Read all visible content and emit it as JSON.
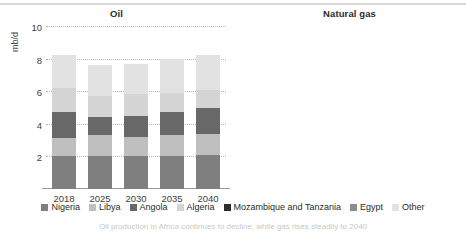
{
  "top_rule": true,
  "legend": {
    "items": [
      {
        "label": "Nigeria",
        "color": "#7f7f7f"
      },
      {
        "label": "Libya",
        "color": "#bfbfbf"
      },
      {
        "label": "Angola",
        "color": "#686868"
      },
      {
        "label": "Algeria",
        "color": "#d4d4d4"
      },
      {
        "label": "Mozambique and Tanzania",
        "color": "#2b2b2b"
      },
      {
        "label": "Egypt",
        "color": "#8c8c8c"
      },
      {
        "label": "Other",
        "color": "#e2e2e2"
      }
    ]
  },
  "caption": "Oil production in Africa continues to decline, while gas rises steadily to 2040",
  "chart_data": [
    {
      "type": "bar",
      "stacked": true,
      "title": "Oil",
      "xlabel": "",
      "ylabel": "mb/d",
      "ylim": [
        0,
        10
      ],
      "yticks": [
        2,
        4,
        6,
        8,
        10
      ],
      "grid": true,
      "legend_position": "bottom",
      "categories": [
        "2018",
        "2025",
        "2030",
        "2035",
        "2040"
      ],
      "series": [
        {
          "name": "Nigeria",
          "color": "#7f7f7f",
          "values": [
            2.0,
            2.0,
            2.0,
            2.0,
            2.1
          ]
        },
        {
          "name": "Libya",
          "color": "#bfbfbf",
          "values": [
            1.1,
            1.3,
            1.2,
            1.3,
            1.3
          ]
        },
        {
          "name": "Angola",
          "color": "#686868",
          "values": [
            1.6,
            1.1,
            1.3,
            1.4,
            1.6
          ]
        },
        {
          "name": "Algeria",
          "color": "#d4d4d4",
          "values": [
            1.5,
            1.3,
            1.3,
            1.2,
            1.1
          ]
        },
        {
          "name": "Mozambique and Tanzania",
          "color": "#2b2b2b",
          "values": [
            0.0,
            0.0,
            0.0,
            0.0,
            0.0
          ]
        },
        {
          "name": "Egypt",
          "color": "#8c8c8c",
          "values": [
            0.0,
            0.0,
            0.0,
            0.0,
            0.0
          ]
        },
        {
          "name": "Other",
          "color": "#e2e2e2",
          "values": [
            2.0,
            1.9,
            1.9,
            2.1,
            2.1
          ]
        }
      ],
      "totals": [
        8.2,
        7.6,
        7.7,
        8.0,
        8.2
      ]
    },
    {
      "type": "bar",
      "stacked": true,
      "title": "Natural gas",
      "xlabel": "",
      "ylabel": "bcm",
      "ylim": [
        0,
        500
      ],
      "yticks": [
        100,
        200,
        300,
        400,
        500
      ],
      "grid": true,
      "legend_position": "bottom",
      "categories": [
        "2018",
        "2025",
        "2030",
        "2035",
        "2040"
      ],
      "series": [
        {
          "name": "Nigeria",
          "color": "#7f7f7f",
          "values": [
            45,
            45,
            50,
            55,
            60
          ]
        },
        {
          "name": "Libya",
          "color": "#bfbfbf",
          "values": [
            10,
            10,
            12,
            14,
            16
          ]
        },
        {
          "name": "Angola",
          "color": "#686868",
          "values": [
            8,
            8,
            10,
            14,
            20
          ]
        },
        {
          "name": "Algeria",
          "color": "#d4d4d4",
          "values": [
            88,
            95,
            105,
            118,
            120
          ]
        },
        {
          "name": "Mozambique and Tanzania",
          "color": "#2b2b2b",
          "values": [
            2,
            25,
            55,
            80,
            105
          ]
        },
        {
          "name": "Egypt",
          "color": "#8c8c8c",
          "values": [
            68,
            75,
            95,
            95,
            90
          ]
        },
        {
          "name": "Other",
          "color": "#e2e2e2",
          "values": [
            24,
            32,
            43,
            59,
            89
          ]
        }
      ],
      "totals": [
        245,
        290,
        370,
        435,
        500
      ]
    }
  ]
}
